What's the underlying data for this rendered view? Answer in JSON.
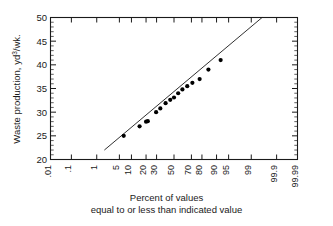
{
  "chart_data": {
    "type": "scatter",
    "title": "",
    "subtitle": "",
    "xlabel": "Percent of values equal to or less than indicated value",
    "ylabel": "Waste production, yd3/wk.",
    "ylabel_prefix": "Waste  production, yd",
    "ylabel_superscript": "3",
    "ylabel_suffix": "/wk.",
    "x_axis_type": "normal-probability",
    "xlim": [
      0.01,
      99.99
    ],
    "ylim": [
      20,
      50
    ],
    "y_major_step": 5,
    "y_minor_step": 1,
    "grid": false,
    "legend": null,
    "x_tick_labels": [
      ".01",
      ".1",
      "1",
      "5",
      "10",
      "20",
      "30",
      "50",
      "70",
      "80",
      "90",
      "95",
      "99",
      "99.9",
      "99.99"
    ],
    "x_tick_values": [
      0.01,
      0.1,
      1,
      5,
      10,
      20,
      30,
      50,
      70,
      80,
      90,
      95,
      99,
      99.9,
      99.99
    ],
    "y_tick_labels": [
      "20",
      "25",
      "30",
      "35",
      "40",
      "45",
      "50"
    ],
    "y_tick_values": [
      20,
      25,
      30,
      35,
      40,
      45,
      50
    ],
    "series": [
      {
        "name": "Waste production observations",
        "marker": "filled-circle",
        "color": "#000000",
        "points": [
          {
            "x": 6.5,
            "y": 25.0
          },
          {
            "x": 15.0,
            "y": 27.0
          },
          {
            "x": 20.0,
            "y": 28.0
          },
          {
            "x": 21.5,
            "y": 28.1
          },
          {
            "x": 29.5,
            "y": 30.0
          },
          {
            "x": 34.0,
            "y": 30.8
          },
          {
            "x": 40.0,
            "y": 31.9
          },
          {
            "x": 45.5,
            "y": 32.6
          },
          {
            "x": 50.0,
            "y": 33.1
          },
          {
            "x": 55.0,
            "y": 34.0
          },
          {
            "x": 60.0,
            "y": 34.8
          },
          {
            "x": 65.5,
            "y": 35.5
          },
          {
            "x": 71.0,
            "y": 36.2
          },
          {
            "x": 78.0,
            "y": 37.0
          },
          {
            "x": 85.0,
            "y": 39.0
          },
          {
            "x": 92.0,
            "y": 41.0
          }
        ]
      }
    ],
    "fit_line": {
      "name": "fitted straight line",
      "color": "#1a1a1a",
      "start": {
        "x": 1.8,
        "y": 22.0
      },
      "end": {
        "x": 99.6,
        "y": 50.0
      }
    }
  },
  "caption": {
    "line1": "Percent of values",
    "line2": "equal to or less than indicated value"
  }
}
